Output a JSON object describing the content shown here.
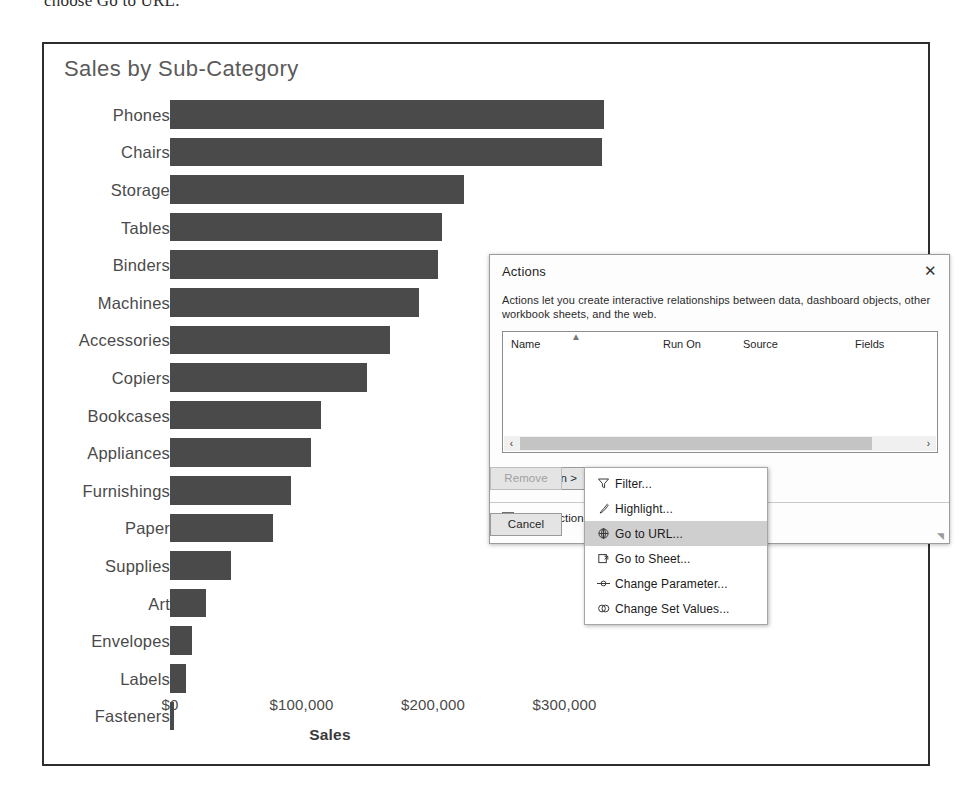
{
  "top_caption": "choose Go to URL.",
  "chart": {
    "title": "Sales by Sub-Category",
    "x_axis_title": "Sales",
    "x_ticks": [
      "$0",
      "$100,000",
      "$200,000",
      "$300,000"
    ]
  },
  "chart_data": {
    "type": "bar",
    "orientation": "horizontal",
    "title": "Sales by Sub-Category",
    "xlabel": "Sales",
    "ylabel": "",
    "xlim": [
      0,
      330000
    ],
    "grid": false,
    "legend": null,
    "bar_color": "#4a4a4a",
    "categories": [
      "Phones",
      "Chairs",
      "Storage",
      "Tables",
      "Binders",
      "Machines",
      "Accessories",
      "Copiers",
      "Bookcases",
      "Appliances",
      "Furnishings",
      "Paper",
      "Supplies",
      "Art",
      "Envelopes",
      "Labels",
      "Fasteners"
    ],
    "values": [
      330007,
      328449,
      223844,
      206966,
      203413,
      189239,
      167380,
      149528,
      114880,
      107532,
      91705,
      78479,
      46674,
      27119,
      16476,
      12486,
      3024
    ],
    "tick_values": [
      0,
      100000,
      200000,
      300000
    ],
    "tick_labels": [
      "$0",
      "$100,000",
      "$200,000",
      "$300,000"
    ]
  },
  "dialog": {
    "title": "Actions",
    "close_icon": "close-icon",
    "description": "Actions let you create interactive relationships between data, dashboard objects, other workbook sheets, and the web.",
    "columns": [
      "Name",
      "Run On",
      "Source",
      "Fields"
    ],
    "rows": [],
    "scroll": {
      "left_arrow": "‹",
      "right_arrow": "›"
    },
    "buttons": {
      "add_action": "Add Action >",
      "edit": "Edit...",
      "remove": "Remove",
      "ok": "OK",
      "cancel": "Cancel"
    },
    "show_action_label": "Show action",
    "show_action_checked": false
  },
  "context_menu": {
    "items": [
      {
        "label": "Filter...",
        "icon": "filter-icon",
        "selected": false
      },
      {
        "label": "Highlight...",
        "icon": "highlight-pen-icon",
        "selected": false
      },
      {
        "label": "Go to URL...",
        "icon": "globe-icon",
        "selected": true
      },
      {
        "label": "Go to Sheet...",
        "icon": "sheet-arrow-icon",
        "selected": false
      },
      {
        "label": "Change Parameter...",
        "icon": "parameter-slider-icon",
        "selected": false
      },
      {
        "label": "Change Set Values...",
        "icon": "set-values-icon",
        "selected": false
      }
    ]
  }
}
